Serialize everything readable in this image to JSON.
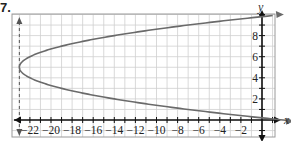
{
  "figure_label": "7.",
  "chart_data": {
    "type": "line",
    "title": "",
    "xlabel": "x",
    "ylabel": "y",
    "xlim": [
      -24,
      1
    ],
    "ylim": [
      -1.5,
      10.5
    ],
    "grid": true,
    "x_tick_labels": [
      "-22",
      "-20",
      "-18",
      "-16",
      "-14",
      "-12",
      "-10",
      "-8",
      "-6",
      "-4",
      "-2"
    ],
    "y_tick_labels": [
      "2",
      "4",
      "6",
      "8"
    ],
    "x_ticks": [
      -22,
      -20,
      -18,
      -16,
      -14,
      -12,
      -10,
      -8,
      -6,
      -4,
      -2
    ],
    "y_ticks": [
      2,
      4,
      6,
      8
    ],
    "asymptote_dashed": {
      "x": -23,
      "description": "dashed vertical line"
    },
    "series": [
      {
        "name": "x = (y-5)^2 - 23",
        "equation": "x = (y - 5)^2 - 23",
        "vertex": [
          -23,
          5
        ],
        "arrows": "both ends",
        "points": [
          {
            "x": 2,
            "y": 0
          },
          {
            "x": -7,
            "y": 1
          },
          {
            "x": -14,
            "y": 2
          },
          {
            "x": -19,
            "y": 3
          },
          {
            "x": -22,
            "y": 4
          },
          {
            "x": -23,
            "y": 5
          },
          {
            "x": -22,
            "y": 6
          },
          {
            "x": -19,
            "y": 7
          },
          {
            "x": -14,
            "y": 8
          },
          {
            "x": -7,
            "y": 9
          },
          {
            "x": 2,
            "y": 10
          }
        ]
      }
    ],
    "colors": {
      "curve": "#6a6a6a",
      "axes": "#111111",
      "grid": "#cfcfcf",
      "frame": "#9a9a9a"
    }
  }
}
